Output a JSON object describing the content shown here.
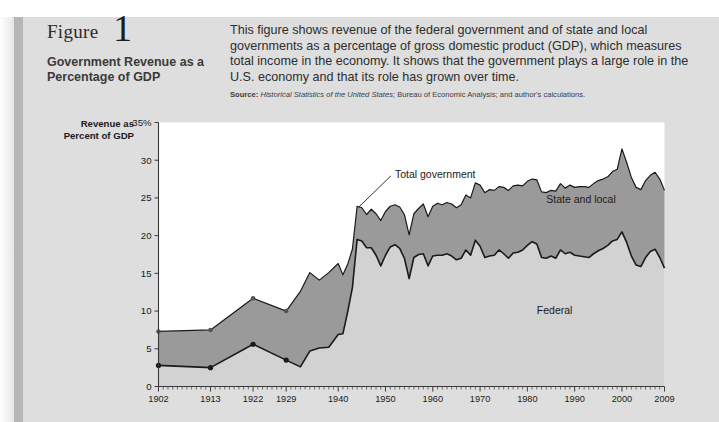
{
  "figure": {
    "label": "Figure",
    "number": "1",
    "title": "Government Revenue as a Percentage of GDP",
    "description": "This figure shows revenue of the federal government and of state and local governments as a percentage of gross domestic product (GDP), which measures total income in the economy. It shows that the government plays a large role in the U.S. economy and that its role has grown over time.",
    "source_label": "Source:",
    "source_italic": "Historical Statistics of the United States;",
    "source_rest": "Bureau of Economic Analysis; and author's calculations."
  },
  "colors": {
    "panel": "#dedede",
    "panel_spine": "#b6b6b6",
    "plot_background": "#ffffff",
    "federal_fill": "#d2d2d2",
    "state_local_fill": "#9a9a9a",
    "line": "#1a1a1a"
  },
  "chart_data": {
    "type": "area",
    "title": "Government Revenue as a Percentage of GDP",
    "xlabel": "",
    "ylabel": "Revenue as Percent of GDP",
    "ylim": [
      0,
      35
    ],
    "xlim": [
      1902,
      2009
    ],
    "yticks": [
      0,
      5,
      10,
      15,
      20,
      25,
      30,
      35
    ],
    "ytick_labels": [
      "0",
      "5",
      "10",
      "15",
      "20",
      "25",
      "30",
      "35%"
    ],
    "xticks": [
      1902,
      1913,
      1922,
      1929,
      1940,
      1950,
      1960,
      1970,
      1980,
      1990,
      2000,
      2009
    ],
    "xtick_labels": [
      "1902",
      "1913",
      "1922",
      "1929",
      "1940",
      "1950",
      "1960",
      "1970",
      "1980",
      "1990",
      "2000",
      "2009"
    ],
    "grid": false,
    "legend": "inline annotations",
    "annotations": [
      {
        "text": "Total government",
        "x": 1952,
        "y": 27.6
      },
      {
        "text": "State and local",
        "x": 1984,
        "y": 24.3
      },
      {
        "text": "Federal",
        "x": 1982,
        "y": 9.6
      }
    ],
    "series": [
      {
        "name": "Federal",
        "marker_years": [
          1902,
          1913,
          1922,
          1929
        ],
        "x": [
          1902,
          1913,
          1922,
          1929,
          1932,
          1934,
          1936,
          1938,
          1940,
          1941,
          1942,
          1943,
          1944,
          1945,
          1946,
          1947,
          1948,
          1949,
          1950,
          1951,
          1952,
          1953,
          1954,
          1955,
          1956,
          1957,
          1958,
          1959,
          1960,
          1961,
          1962,
          1963,
          1964,
          1965,
          1966,
          1967,
          1968,
          1969,
          1970,
          1971,
          1972,
          1973,
          1974,
          1975,
          1976,
          1977,
          1978,
          1979,
          1980,
          1981,
          1982,
          1983,
          1984,
          1985,
          1986,
          1987,
          1988,
          1989,
          1990,
          1991,
          1992,
          1993,
          1994,
          1995,
          1996,
          1997,
          1998,
          1999,
          2000,
          2001,
          2002,
          2003,
          2004,
          2005,
          2006,
          2007,
          2008,
          2009
        ],
        "y": [
          2.8,
          2.5,
          5.6,
          3.5,
          2.6,
          4.7,
          5.1,
          5.2,
          6.9,
          7.0,
          9.9,
          13.1,
          19.5,
          19.3,
          18.4,
          18.4,
          17.4,
          16.0,
          17.4,
          18.5,
          18.8,
          18.3,
          17.0,
          14.3,
          17.1,
          17.5,
          17.6,
          16.0,
          17.3,
          17.4,
          17.4,
          17.6,
          17.3,
          16.8,
          17.0,
          18.1,
          17.4,
          19.4,
          18.6,
          17.1,
          17.3,
          17.4,
          18.1,
          17.6,
          17.0,
          17.7,
          17.8,
          18.1,
          18.7,
          19.2,
          18.9,
          17.1,
          17.0,
          17.3,
          17.0,
          18.1,
          17.6,
          17.8,
          17.4,
          17.3,
          17.2,
          17.1,
          17.6,
          18.0,
          18.3,
          18.7,
          19.3,
          19.5,
          20.5,
          19.1,
          17.3,
          16.1,
          15.9,
          17.1,
          17.9,
          18.2,
          17.1,
          15.7
        ]
      },
      {
        "name": "State and local",
        "marker_years": [
          1902,
          1913,
          1922,
          1929
        ],
        "x": [
          1902,
          1913,
          1922,
          1929,
          1932,
          1934,
          1936,
          1938,
          1940,
          1941,
          1942,
          1943,
          1944,
          1945,
          1946,
          1947,
          1948,
          1949,
          1950,
          1951,
          1952,
          1953,
          1954,
          1955,
          1956,
          1957,
          1958,
          1959,
          1960,
          1961,
          1962,
          1963,
          1964,
          1965,
          1966,
          1967,
          1968,
          1969,
          1970,
          1971,
          1972,
          1973,
          1974,
          1975,
          1976,
          1977,
          1978,
          1979,
          1980,
          1981,
          1982,
          1983,
          1984,
          1985,
          1986,
          1987,
          1988,
          1989,
          1990,
          1991,
          1992,
          1993,
          1994,
          1995,
          1996,
          1997,
          1998,
          1999,
          2000,
          2001,
          2002,
          2003,
          2004,
          2005,
          2006,
          2007,
          2008,
          2009
        ],
        "y": [
          4.5,
          5.0,
          6.1,
          6.5,
          10.0,
          10.4,
          9.0,
          9.9,
          9.4,
          7.8,
          6.3,
          5.1,
          4.4,
          4.4,
          4.4,
          5.1,
          5.5,
          6.0,
          5.8,
          5.4,
          5.3,
          5.5,
          5.8,
          5.8,
          5.8,
          6.1,
          6.6,
          6.5,
          6.6,
          6.9,
          6.7,
          6.8,
          6.9,
          6.9,
          7.1,
          7.3,
          7.6,
          7.6,
          8.1,
          8.6,
          8.8,
          8.6,
          8.4,
          8.8,
          9.0,
          8.9,
          8.9,
          8.5,
          8.5,
          8.3,
          8.5,
          8.7,
          8.7,
          8.7,
          8.9,
          8.8,
          8.7,
          8.9,
          9.0,
          9.2,
          9.3,
          9.3,
          9.3,
          9.3,
          9.2,
          9.1,
          9.2,
          9.3,
          11.0,
          10.6,
          10.4,
          10.3,
          10.2,
          10.2,
          10.1,
          10.2,
          10.4,
          10.3
        ]
      }
    ],
    "total_series_name": "Total government",
    "total_note": "Upper boundary of the shaded band equals federal plus state and local revenue."
  }
}
